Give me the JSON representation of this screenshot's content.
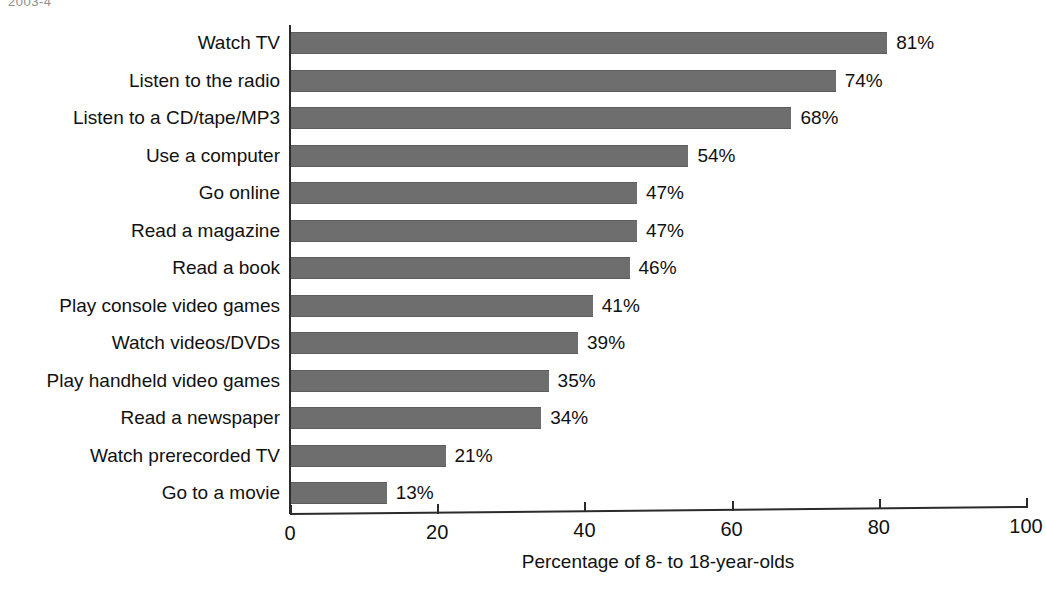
{
  "scan": {
    "fragment_text": "2003-4"
  },
  "chart_data": {
    "type": "bar",
    "orientation": "horizontal",
    "title": "",
    "xlabel": "Percentage of 8- to 18-year-olds",
    "ylabel": "",
    "xlim": [
      0,
      100
    ],
    "xticks": [
      0,
      20,
      40,
      60,
      80,
      100
    ],
    "xtick_labels": [
      "0",
      "20",
      "40",
      "60",
      "80",
      "100"
    ],
    "grid": false,
    "legend": null,
    "bar_color": "#6e6e6e",
    "categories": [
      "Watch TV",
      "Listen to the radio",
      "Listen to a CD/tape/MP3",
      "Use a computer",
      "Go online",
      "Read a magazine",
      "Read a book",
      "Play console video games",
      "Watch videos/DVDs",
      "Play handheld video games",
      "Read a newspaper",
      "Watch prerecorded TV",
      "Go to a movie"
    ],
    "values": [
      81,
      74,
      68,
      54,
      47,
      47,
      46,
      41,
      39,
      35,
      34,
      21,
      13
    ],
    "value_labels": [
      "81%",
      "74%",
      "68%",
      "54%",
      "47%",
      "47%",
      "46%",
      "41%",
      "39%",
      "35%",
      "34%",
      "21%",
      "13%"
    ]
  }
}
